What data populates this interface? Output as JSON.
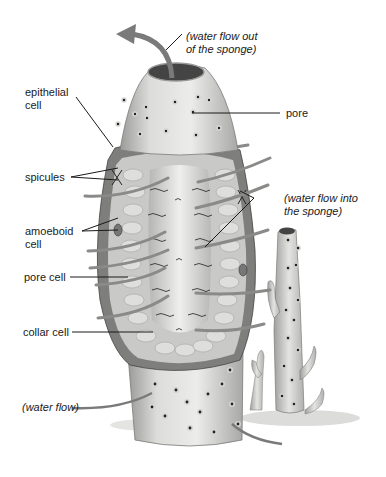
{
  "diagram": {
    "labels": {
      "water_out_1": "(water flow out",
      "water_out_2": "of the sponge)",
      "epithelial_1": "epithelial",
      "epithelial_2": "cell",
      "pore": "pore",
      "spicules": "spicules",
      "water_in_1": "(water flow into",
      "water_in_2": "the sponge)",
      "amoeboid_1": "amoeboid",
      "amoeboid_2": "cell",
      "pore_cell": "pore cell",
      "collar_cell": "collar cell",
      "water_flow": "(water flow)"
    },
    "colors": {
      "background": "#ffffff",
      "body_light": "#e8e8e6",
      "body_mid": "#c8c8c6",
      "body_dark": "#8a8a88",
      "pore": "#222222",
      "arrow": "#7a7a7a",
      "leader": "#1a1a1a",
      "text": "#1a1a1a"
    }
  }
}
